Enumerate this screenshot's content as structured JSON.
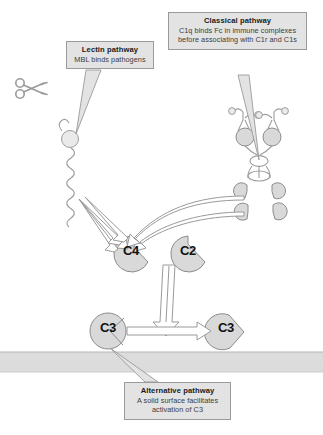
{
  "diagram": {
    "background_color": "#ffffff",
    "fill_color": "#d9d9d9",
    "stroke_color": "#8c8c8c",
    "box_fill": "#e3e3e3",
    "box_border": "#9a9a9a"
  },
  "callouts": [
    {
      "id": "lectin",
      "title": "Lectin pathway",
      "body": "MBL binds pathogens"
    },
    {
      "id": "classical",
      "title": "Classical pathway",
      "body": "C1q binds Fc in immune complexes before associating with C1r and C1s"
    },
    {
      "id": "alternative",
      "title": "Alternative pathway",
      "body": "A solid surface facilitates activation of C3"
    }
  ],
  "molecules": [
    {
      "id": "c4",
      "label": "C4",
      "shape": "pacman"
    },
    {
      "id": "c2",
      "label": "C2",
      "shape": "pacman"
    },
    {
      "id": "c3a",
      "label": "C3",
      "shape": "circle-cleaved"
    },
    {
      "id": "c3b",
      "label": "C3",
      "shape": "pacman"
    }
  ],
  "icons": {
    "scissors": "scissors-icon",
    "mbl": "mbl-icon",
    "antibody": "antibody-icon",
    "c1q": "c1q-icon",
    "protease": "protease-icon"
  },
  "surface": {
    "name": "solid-surface-band",
    "color": "#dcdcdc"
  }
}
